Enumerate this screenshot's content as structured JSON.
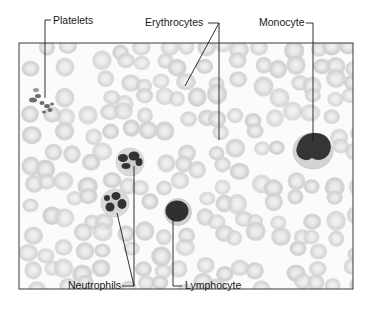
{
  "figure": {
    "type": "labeled micrograph",
    "frame": {
      "x": 19,
      "y": 43,
      "width": 334,
      "height": 246,
      "stroke": "#3a3a3a"
    },
    "colors": {
      "background": "#ffffff",
      "smear": "#fbfbfb",
      "rbc_fill": "#d4d4d4",
      "rbc_center": "#ededed",
      "nucleus": "#3a3a3a",
      "cytoplasm": "#cfcfcf",
      "leader": "#1a1a1a"
    }
  },
  "labels": {
    "platelets": "Platelets",
    "erythrocytes": "Erythrocytes",
    "monocyte": "Monocyte",
    "neutrophils": "Neutrophils",
    "lymphocyte": "Lymphocyte"
  }
}
